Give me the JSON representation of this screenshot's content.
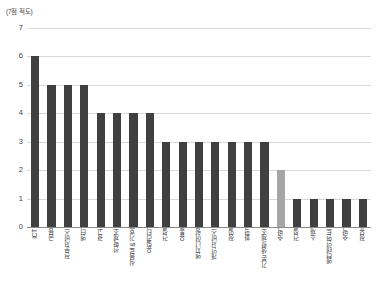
{
  "chart_data": {
    "type": "bar",
    "title": "",
    "subtitle": "",
    "xlabel": "",
    "ylabel": "(7점 적도)",
    "ylim": [
      0,
      7
    ],
    "ytick_labels": [
      "7",
      "6",
      "5",
      "4",
      "3",
      "2",
      "1",
      "0"
    ],
    "yticks": [
      7,
      6,
      5,
      4,
      3,
      2,
      1,
      0
    ],
    "grid": true,
    "legend": "none",
    "categories": [
      "ICT",
      "금융",
      "전문서비스",
      "엔터",
      "광고",
      "선박제조",
      "식음료 & 기호",
      "유틸리티",
      "건설",
      "유통",
      "엔지니어링",
      "개인 서비스",
      "정밀",
      "화학",
      "기본 생활 제조",
      "숙박",
      "건설",
      "소재",
      "엔터테인먼트",
      "숙박",
      "정유"
    ],
    "values": [
      6,
      5,
      5,
      5,
      4,
      4,
      4,
      4,
      3,
      3,
      3,
      3,
      3,
      3,
      3,
      2,
      1,
      1,
      1,
      1,
      1
    ],
    "highlight_index": 15,
    "colors": {
      "bar": "#404040",
      "bar_highlight": "#a6a6a6",
      "gridline": "#d9d9d9",
      "axis": "#8a8a8a"
    }
  }
}
